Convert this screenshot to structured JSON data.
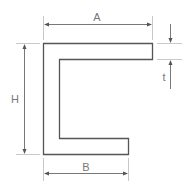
{
  "diagram": {
    "labels": {
      "A": "A",
      "B": "B",
      "H": "H",
      "t": "t"
    },
    "colors": {
      "outline": "#555555",
      "dimension": "#555555",
      "extension": "#bbbbbb",
      "label": "#777777"
    }
  }
}
